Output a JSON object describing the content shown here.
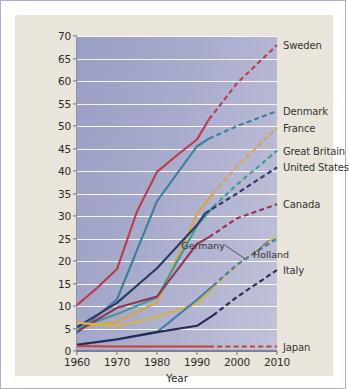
{
  "figure": {
    "background": "#e9e5da",
    "plot_background": "#a7abcb",
    "frame_color": "#aab2cf"
  },
  "chart_data": {
    "type": "line",
    "title": "",
    "xlabel": "Year",
    "ylabel": "Percentage of All Births",
    "xlim": [
      1960,
      2010
    ],
    "ylim": [
      0,
      70
    ],
    "xticks": [
      1960,
      1970,
      1980,
      1990,
      2000,
      2010
    ],
    "yticks": [
      0,
      5,
      10,
      15,
      20,
      25,
      30,
      35,
      40,
      45,
      50,
      55,
      60,
      65,
      70
    ],
    "grid": "horizontal",
    "legend_position": "right-of-axes-at-line-end",
    "note": "Solid segments are observed data; dashed segments are projections.",
    "annotations": [
      {
        "text": "Germany",
        "x": 1997,
        "y": 23.5,
        "leader_to": {
          "x": 2002,
          "y": 20.5
        }
      },
      {
        "text": "Holland",
        "x": 2004,
        "y": 21.5,
        "leader_to": {
          "x": 2008,
          "y": 24.6
        }
      }
    ],
    "series": [
      {
        "name": "Sweden",
        "color": "#c0394b",
        "label_y": 68.0,
        "solid": [
          [
            1960,
            10.2
          ],
          [
            1965,
            14.0
          ],
          [
            1970,
            18.2
          ],
          [
            1975,
            31.0
          ],
          [
            1980,
            39.8
          ],
          [
            1985,
            43.5
          ],
          [
            1990,
            47.0
          ],
          [
            1993,
            51.5
          ]
        ],
        "dashed": [
          [
            1993,
            51.5
          ],
          [
            2000,
            59.5
          ],
          [
            2010,
            68.0
          ]
        ]
      },
      {
        "name": "Denmark",
        "color": "#3a7f9e",
        "label_y": 53.3,
        "solid": [
          [
            1960,
            4.0
          ],
          [
            1970,
            11.5
          ],
          [
            1980,
            33.3
          ],
          [
            1990,
            45.5
          ],
          [
            1993,
            47.2
          ]
        ],
        "dashed": [
          [
            1993,
            47.2
          ],
          [
            2000,
            50.0
          ],
          [
            2010,
            53.3
          ]
        ]
      },
      {
        "name": "France",
        "color": "#d9a441",
        "label_y": 49.6,
        "solid": [
          [
            1960,
            5.2
          ],
          [
            1970,
            6.5
          ],
          [
            1980,
            10.8
          ],
          [
            1990,
            30.5
          ],
          [
            1994,
            35.0
          ]
        ],
        "dashed": [
          [
            1994,
            35.0
          ],
          [
            2000,
            41.0
          ],
          [
            2010,
            49.6
          ]
        ]
      },
      {
        "name": "Great Britain",
        "color": "#3f9a96",
        "label_y": 44.5,
        "solid": [
          [
            1960,
            5.0
          ],
          [
            1970,
            8.2
          ],
          [
            1980,
            11.9
          ],
          [
            1990,
            27.8
          ],
          [
            1994,
            32.0
          ]
        ],
        "dashed": [
          [
            1994,
            32.0
          ],
          [
            2000,
            37.0
          ],
          [
            2010,
            44.5
          ]
        ]
      },
      {
        "name": "United States",
        "color": "#2b3a66",
        "label_y": 40.8,
        "solid": [
          [
            1960,
            5.3
          ],
          [
            1970,
            10.7
          ],
          [
            1980,
            18.4
          ],
          [
            1990,
            28.0
          ],
          [
            1992,
            30.6
          ]
        ],
        "dashed": [
          [
            1992,
            30.6
          ],
          [
            2000,
            35.0
          ],
          [
            2010,
            40.8
          ]
        ]
      },
      {
        "name": "Canada",
        "color": "#93344f",
        "label_y": 32.6,
        "solid": [
          [
            1960,
            4.3
          ],
          [
            1970,
            9.6
          ],
          [
            1980,
            12.1
          ],
          [
            1990,
            23.8
          ],
          [
            1993,
            25.3
          ]
        ],
        "dashed": [
          [
            1993,
            25.3
          ],
          [
            2000,
            29.5
          ],
          [
            2010,
            32.6
          ]
        ]
      },
      {
        "name": "Germany",
        "color": "#d9b441",
        "label_y": 25.6,
        "solid": [
          [
            1960,
            6.3
          ],
          [
            1970,
            5.5
          ],
          [
            1980,
            7.6
          ],
          [
            1990,
            10.5
          ],
          [
            1994,
            14.0
          ]
        ],
        "dashed": [
          [
            1994,
            14.0
          ],
          [
            2000,
            19.0
          ],
          [
            2010,
            25.6
          ]
        ]
      },
      {
        "name": "Holland",
        "color": "#3f7fa8",
        "label_y": 25.0,
        "solid": [
          [
            1960,
            1.4
          ],
          [
            1970,
            2.5
          ],
          [
            1980,
            4.2
          ],
          [
            1990,
            11.4
          ],
          [
            1994,
            14.5
          ]
        ],
        "dashed": [
          [
            1994,
            14.5
          ],
          [
            2000,
            19.2
          ],
          [
            2010,
            25.0
          ]
        ]
      },
      {
        "name": "Italy",
        "color": "#232a55",
        "label_y": 18.0,
        "solid": [
          [
            1960,
            1.4
          ],
          [
            1970,
            2.6
          ],
          [
            1980,
            4.2
          ],
          [
            1990,
            5.6
          ],
          [
            1994,
            7.9
          ]
        ],
        "dashed": [
          [
            1994,
            7.9
          ],
          [
            2000,
            12.0
          ],
          [
            2010,
            18.0
          ]
        ]
      },
      {
        "name": "Japan",
        "color": "#c8432f",
        "label_y": 1.0,
        "solid": [
          [
            1960,
            1.1
          ],
          [
            1970,
            1.0
          ],
          [
            1980,
            1.0
          ],
          [
            1990,
            1.0
          ],
          [
            1993,
            1.0
          ]
        ],
        "dashed": [
          [
            1993,
            1.0
          ],
          [
            2000,
            1.0
          ],
          [
            2010,
            1.0
          ]
        ]
      }
    ]
  }
}
